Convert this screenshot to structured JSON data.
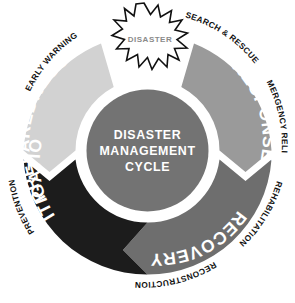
{
  "diagram": {
    "title": "Disaster Management Cycle",
    "hub": {
      "lines": [
        "DISASTER",
        "MANAGEMENT",
        "CYCLE"
      ],
      "color": "#737373",
      "text_color": "#ffffff"
    },
    "burst": {
      "label": "DISASTER",
      "fill": "#ffffff",
      "stroke": "#111111",
      "text_color": "#8a8a8a"
    },
    "segments": [
      {
        "id": "preparedness",
        "label": "PREPAREDNESS",
        "color": "#d2d2d2",
        "text_color": "#ffffff",
        "outer_labels": [
          "EARLY WARNING"
        ]
      },
      {
        "id": "response",
        "label": "RESPONSE",
        "color": "#9a9a9a",
        "text_color": "#ffffff",
        "outer_labels": [
          "SEARCH & RESCUE",
          "EMERGENCY RELIEF"
        ]
      },
      {
        "id": "recovery",
        "label": "RECOVERY",
        "color": "#6e6e6e",
        "text_color": "#ffffff",
        "outer_labels": [
          "REHABILITATION",
          "RECONSTRUCTION"
        ]
      },
      {
        "id": "mitigation",
        "label": "MITIGATION",
        "color": "#1c1c1c",
        "text_color": "#ffffff",
        "outer_labels": [
          "PREVENTION"
        ]
      }
    ],
    "outer_labels": {
      "early_warning": "EARLY WARNING",
      "search_rescue": "SEARCH & RESCUE",
      "emergency_relief": "EMERGENCY RELIEF",
      "rehabilitation": "REHABILITATION",
      "reconstruction": "RECONSTRUCTION",
      "prevention": "PREVENTION"
    },
    "background": "#ffffff"
  }
}
